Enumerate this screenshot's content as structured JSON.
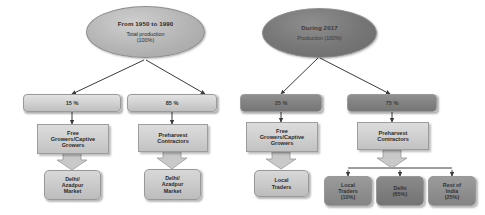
{
  "diagram": {
    "type": "flowchart",
    "branches": [
      {
        "id": "historic",
        "root": {
          "line1": "From 1950 to 1990",
          "line2": "Total production",
          "line3": "(100%)"
        },
        "splits": [
          {
            "percent": "15 %",
            "role": [
              "Free",
              "Growers/Captive",
              "Growers"
            ],
            "terminal": [
              "Delhi/",
              "Azadpur",
              "Market"
            ]
          },
          {
            "percent": "85 %",
            "role": [
              "Preharvest",
              "Contractors"
            ],
            "terminal": [
              "Delhi/",
              "Azadpur",
              "Market"
            ]
          }
        ]
      },
      {
        "id": "current",
        "root": {
          "line1": "During 2017",
          "line2": "Production (100%)",
          "line3": ""
        },
        "splits": [
          {
            "percent": "25 %",
            "role": [
              "Free",
              "Growers/Captive",
              "Growers"
            ],
            "terminal": [
              "Local",
              "Traders"
            ]
          },
          {
            "percent": "75 %",
            "role": [
              "Preharvest",
              "Contractors"
            ],
            "terminals": [
              [
                "Local",
                "Traders",
                "(10%)"
              ],
              [
                "Delhi",
                "(65%)"
              ],
              [
                "Rest of",
                "India",
                "(25%)"
              ]
            ]
          }
        ]
      }
    ]
  },
  "colors": {
    "ellipse_light": "#b4b4b4",
    "ellipse_dark": "#767676",
    "bar_light": "#d2d2d2",
    "bar_dark": "#828282",
    "box_fill": "#cfcfcf",
    "connector": "#3a3a3a",
    "background": "#ffffff"
  }
}
